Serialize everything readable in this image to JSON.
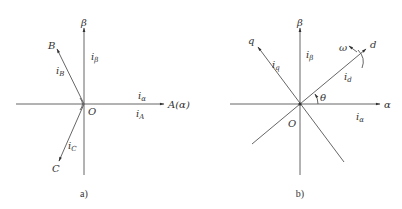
{
  "diagram_a": {
    "caption": "a)",
    "origin_label": "O",
    "axes": {
      "alpha": "A(α)",
      "beta": "β",
      "B": "B",
      "C": "C"
    },
    "currents": {
      "i_alpha": {
        "main": "i",
        "sub": "α"
      },
      "i_beta": {
        "main": "i",
        "sub": "β"
      },
      "i_A": {
        "main": "i",
        "sub": "A"
      },
      "i_B": {
        "main": "i",
        "sub": "B"
      },
      "i_C": {
        "main": "i",
        "sub": "C"
      }
    }
  },
  "diagram_b": {
    "caption": "b)",
    "origin_label": "O",
    "axes": {
      "alpha": "α",
      "beta": "β",
      "d": "d",
      "q": "q"
    },
    "angle_label": "θ",
    "rotation_label": "ω",
    "currents": {
      "i_alpha": {
        "main": "i",
        "sub": "α"
      },
      "i_beta": {
        "main": "i",
        "sub": "β"
      },
      "i_d": {
        "main": "i",
        "sub": "d"
      },
      "i_q": {
        "main": "i",
        "sub": "q"
      }
    }
  }
}
